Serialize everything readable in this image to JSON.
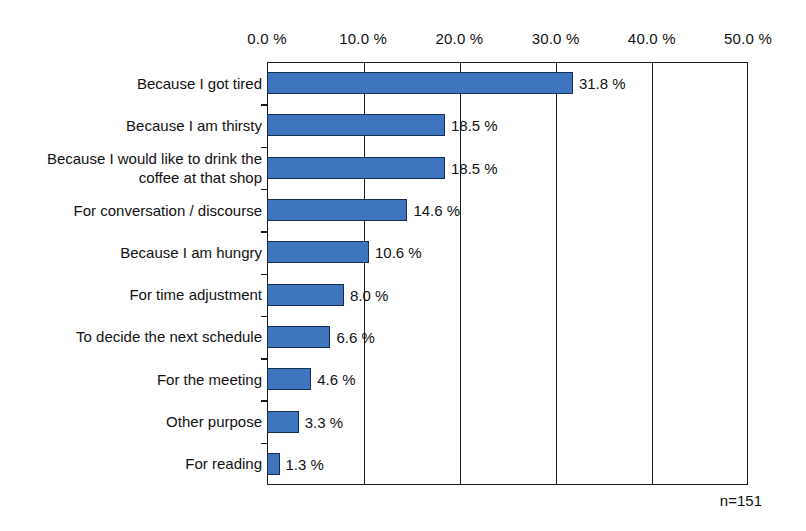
{
  "chart_data": {
    "type": "bar",
    "orientation": "horizontal",
    "title": "",
    "xlabel": "",
    "ylabel": "",
    "xlim": [
      0,
      50
    ],
    "grid": true,
    "legend": false,
    "xticks": [
      "0.0 %",
      "10.0 %",
      "20.0 %",
      "30.0 %",
      "40.0 %",
      "50.0 %"
    ],
    "xtick_values": [
      0,
      10,
      20,
      30,
      40,
      50
    ],
    "categories": [
      "Because I got tired",
      "Because I am thirsty",
      "Because I would like to drink the\ncoffee at that shop",
      "For conversation / discourse",
      "Because I am hungry",
      "For time adjustment",
      "To decide the next schedule",
      "For the meeting",
      "Other purpose",
      "For reading"
    ],
    "values": [
      31.8,
      18.5,
      18.5,
      14.6,
      10.6,
      8.0,
      6.6,
      4.6,
      3.3,
      1.3
    ],
    "value_labels": [
      "31.8 %",
      "18.5 %",
      "18.5 %",
      "14.6 %",
      "10.6 %",
      "8.0 %",
      "6.6 %",
      "4.6 %",
      "3.3 %",
      "1.3 %"
    ],
    "annotation": "n=151",
    "bar_color": "#3f75bf",
    "bar_edge_color": "#17304f",
    "axis_color": "#1b1b1b",
    "background_color": "#ffffff"
  }
}
